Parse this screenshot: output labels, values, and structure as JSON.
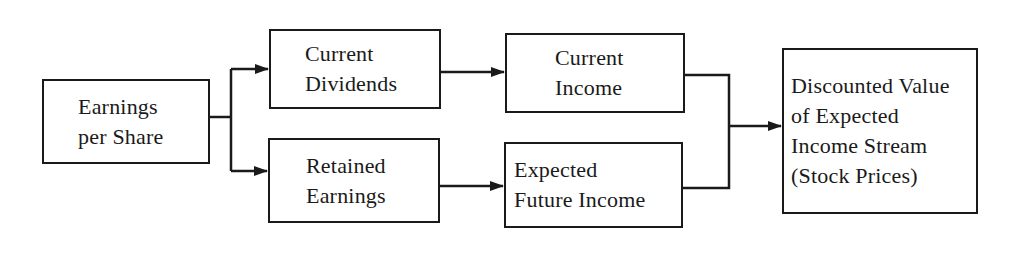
{
  "diagram": {
    "type": "flowchart",
    "direction": "left-to-right",
    "nodes": [
      {
        "id": "eps",
        "lines": [
          "Earnings",
          "per Share"
        ]
      },
      {
        "id": "current_dividends",
        "lines": [
          "Current",
          "Dividends"
        ]
      },
      {
        "id": "retained_earnings",
        "lines": [
          "Retained",
          "Earnings"
        ]
      },
      {
        "id": "current_income",
        "lines": [
          "Current",
          "Income"
        ]
      },
      {
        "id": "expected_future_income",
        "lines": [
          "Expected",
          "Future Income"
        ]
      },
      {
        "id": "discounted_value",
        "lines": [
          "Discounted Value",
          "of Expected",
          "Income Stream",
          "(Stock Prices)"
        ]
      }
    ],
    "edges": [
      {
        "from": "eps",
        "to": "current_dividends"
      },
      {
        "from": "eps",
        "to": "retained_earnings"
      },
      {
        "from": "current_dividends",
        "to": "current_income"
      },
      {
        "from": "retained_earnings",
        "to": "expected_future_income"
      },
      {
        "from": "current_income",
        "to": "discounted_value"
      },
      {
        "from": "expected_future_income",
        "to": "discounted_value"
      }
    ],
    "colors": {
      "stroke": "#1a1a1a",
      "background": "#ffffff",
      "text": "#1a1a1a"
    }
  }
}
